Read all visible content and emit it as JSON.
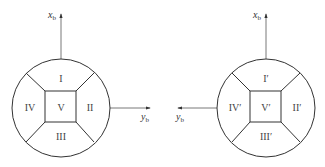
{
  "diagram": {
    "left": {
      "axes": {
        "vertical": "x",
        "vertical_sub": "b",
        "horizontal": "y",
        "horizontal_sub": "b",
        "horizontal_direction": "right"
      },
      "regions": {
        "top": "I",
        "right": "II",
        "bottom": "III",
        "left": "IV",
        "center": "V"
      }
    },
    "right": {
      "axes": {
        "vertical": "x",
        "vertical_sub": "b",
        "horizontal": "y",
        "horizontal_sub": "b",
        "horizontal_direction": "left"
      },
      "regions": {
        "top": "I′",
        "right": "II′",
        "bottom": "III′",
        "left": "IV′",
        "center": "V′"
      }
    },
    "colors": {
      "line": "#333333",
      "axis": "#555555",
      "text": "#444444"
    }
  }
}
